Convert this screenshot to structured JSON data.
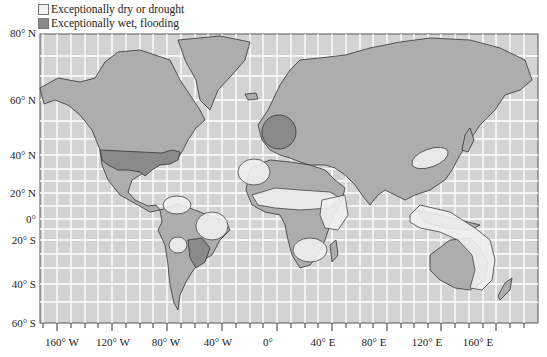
{
  "legend": {
    "items": [
      {
        "label": "Exceptionally dry or drought",
        "color": "#f2f2f2"
      },
      {
        "label": "Exceptionally wet, flooding",
        "color": "#8a8a8a"
      }
    ]
  },
  "colors": {
    "ocean": "#d3d3d3",
    "land": "#adadad",
    "wet": "#8a8a8a",
    "dry": "#f0f0f0",
    "grid": "#ffffff",
    "border": "#333333"
  },
  "axes": {
    "latitude_labels": [
      {
        "label": "80° N",
        "y": 34
      },
      {
        "label": "60° N",
        "y": 100
      },
      {
        "label": "40° N",
        "y": 155
      },
      {
        "label": "20° N",
        "y": 193
      },
      {
        "label": "0°",
        "y": 219
      },
      {
        "label": "20° S",
        "y": 240
      },
      {
        "label": "40° S",
        "y": 284
      },
      {
        "label": "60° S",
        "y": 323
      }
    ],
    "longitude_labels": [
      {
        "label": "160° W",
        "x": 57
      },
      {
        "label": "120° W",
        "x": 112
      },
      {
        "label": "80° W",
        "x": 167
      },
      {
        "label": "40° W",
        "x": 222
      },
      {
        "label": "0°",
        "x": 277
      },
      {
        "label": "40° E",
        "x": 332
      },
      {
        "label": "80° E",
        "x": 387
      },
      {
        "label": "120° E",
        "x": 441
      },
      {
        "label": "160° E",
        "x": 496
      }
    ]
  },
  "regions": {
    "wet": [
      "United States",
      "Western/Central Europe",
      "Northern Argentina / Paraguay region",
      "Southern Africa patch"
    ],
    "dry": [
      "Northwest Africa",
      "Sahel belt",
      "Horn of Africa / East Africa",
      "Southern Africa",
      "Northern South America",
      "Northeast Brazil",
      "Peru/Bolivia",
      "Northern China",
      "Indonesia / Northern & Eastern Australia"
    ]
  }
}
